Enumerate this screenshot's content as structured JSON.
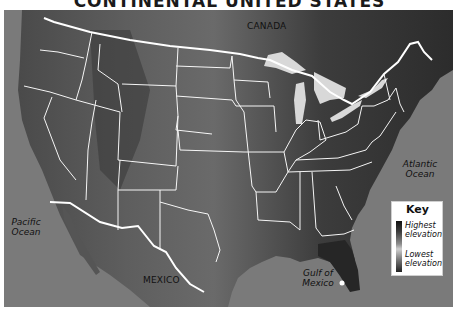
{
  "title": "CONTINENTAL UNITED STATES",
  "labels": {
    "canada": "CANADA",
    "mexico": "MEXICO",
    "pacific_line1": "Pacific",
    "pacific_line2": "Ocean",
    "atlantic_line1": "Atlantic",
    "atlantic_line2": "Ocean",
    "gulf_line1": "Gulf of",
    "gulf_line2": "Mexico"
  },
  "key": {
    "title": "Key",
    "highest_line1": "Highest",
    "highest_line2": "elevation",
    "lowest_line1": "Lowest",
    "lowest_line2": "elevation"
  },
  "colors": {
    "ocean": "#7a7a7a",
    "land_high": "#2a2a2a",
    "land_low": "#5a5a5a",
    "borders": "#ffffff",
    "lakes": "#d8d8d8"
  }
}
